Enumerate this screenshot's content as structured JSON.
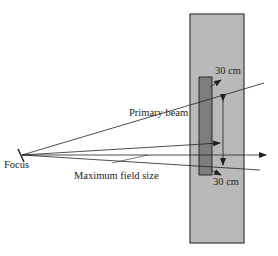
{
  "diagram": {
    "labels": {
      "focus": "Focus",
      "primary_beam": "Primary beam",
      "max_field_size": "Maximum field size",
      "top_distance": "30 cm",
      "bottom_distance": "30 cm"
    },
    "colors": {
      "phantom_fill": "#b9b9b9",
      "phantom_border": "#3a3a3a",
      "detector_fill": "#7d7d7d",
      "line": "#222222"
    }
  }
}
